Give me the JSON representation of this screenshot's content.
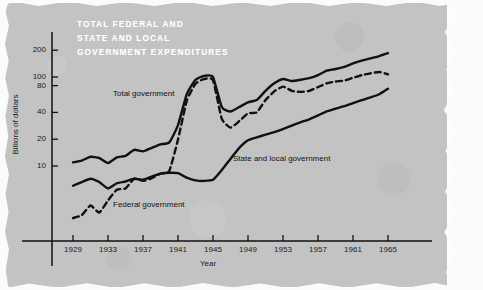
{
  "figure": {
    "caption": "FIG."
  },
  "chart_data": {
    "type": "line",
    "title_lines": [
      "TOTAL FEDERAL AND",
      "STATE AND LOCAL",
      "GOVERNMENT EXPENDITURES"
    ],
    "xlabel": "Year",
    "ylabel": "Billions of dollars",
    "yscale": "log",
    "ylim": [
      2,
      260
    ],
    "xlim": [
      1929,
      1966
    ],
    "grid": false,
    "legend_position": "inline-annotations",
    "y_ticks": [
      10,
      20,
      40,
      80,
      100,
      200
    ],
    "y_tick_labels": [
      "10",
      "20",
      "40",
      "80",
      "100",
      "200"
    ],
    "x_ticks": [
      1929,
      1933,
      1937,
      1941,
      1945,
      1949,
      1953,
      1957,
      1961,
      1965
    ],
    "x_tick_labels": [
      "1929",
      "1933",
      "1937",
      "1941",
      "1945",
      "1949",
      "1953",
      "1957",
      "1961",
      "1965"
    ],
    "x": [
      1929,
      1930,
      1931,
      1932,
      1933,
      1934,
      1935,
      1936,
      1937,
      1938,
      1939,
      1940,
      1941,
      1942,
      1943,
      1944,
      1945,
      1946,
      1947,
      1948,
      1949,
      1950,
      1951,
      1952,
      1953,
      1954,
      1955,
      1956,
      1957,
      1958,
      1959,
      1960,
      1961,
      1962,
      1963,
      1964,
      1965
    ],
    "series": [
      {
        "name": "Total government",
        "style": "solid",
        "color": "#111111",
        "label_text": "Total government",
        "values": [
          11.0,
          11.5,
          12.7,
          12.3,
          10.8,
          12.5,
          13.0,
          15.2,
          14.6,
          16.0,
          17.5,
          18.4,
          28.8,
          64.0,
          93.0,
          103.0,
          100.0,
          46.0,
          41.0,
          46.0,
          52.0,
          55.0,
          70.0,
          85.0,
          95.0,
          90.0,
          93.0,
          97.0,
          105.0,
          118.0,
          123.0,
          130.0,
          142.0,
          153.0,
          162.0,
          172.0,
          185.0
        ]
      },
      {
        "name": "Federal government",
        "style": "dashed",
        "color": "#111111",
        "label_text": "Federal government",
        "values": [
          2.6,
          2.8,
          3.6,
          3.0,
          4.1,
          5.4,
          5.6,
          7.2,
          6.8,
          7.3,
          8.2,
          8.8,
          19.8,
          54.0,
          84.0,
          95.0,
          92.0,
          34.0,
          27.0,
          32.0,
          39.0,
          40.0,
          55.0,
          69.0,
          78.0,
          70.0,
          68.0,
          70.0,
          77.0,
          85.0,
          89.0,
          91.0,
          98.0,
          105.0,
          110.0,
          114.0,
          107.0
        ]
      },
      {
        "name": "State and local government",
        "style": "solid",
        "color": "#111111",
        "label_text": "State and local government",
        "values": [
          6.0,
          6.6,
          7.2,
          6.6,
          5.6,
          6.4,
          6.7,
          7.2,
          7.0,
          7.6,
          8.2,
          8.4,
          8.3,
          7.4,
          6.9,
          6.8,
          7.0,
          9.0,
          12.0,
          16.0,
          19.5,
          21.0,
          22.5,
          24.0,
          26.0,
          28.5,
          31.0,
          33.5,
          37.0,
          41.0,
          44.0,
          47.0,
          51.0,
          55.0,
          59.0,
          64.0,
          74.0
        ]
      }
    ]
  }
}
